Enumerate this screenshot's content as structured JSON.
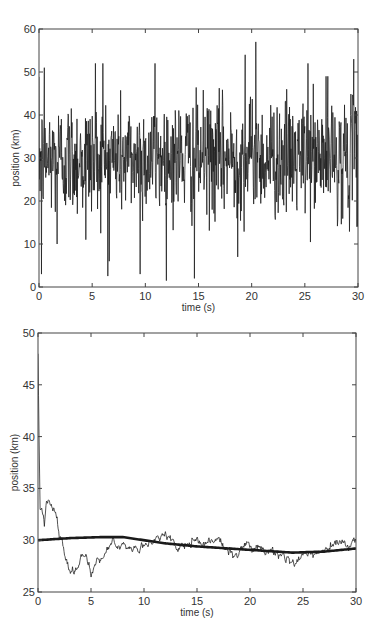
{
  "chart_data": [
    {
      "id": "top",
      "type": "line",
      "title": "",
      "xlabel": "time (s)",
      "ylabel": "position (km)",
      "xlim": [
        0,
        30
      ],
      "ylim": [
        0,
        60
      ],
      "xticks": [
        0,
        5,
        10,
        15,
        20,
        25,
        30
      ],
      "yticks": [
        0,
        10,
        20,
        30,
        40,
        50,
        60
      ],
      "grid": false,
      "legend": null,
      "series": [
        {
          "name": "measured position",
          "style": "thin",
          "color": "#1a1a1a",
          "description": "Noisy measurements around mean ~30 km, std ~8 km, sampled densely over 0-30 s",
          "mean": 30,
          "std": 8,
          "n_points": 900,
          "notable_points": [
            {
              "x": 0.25,
              "y": 3
            },
            {
              "x": 0.5,
              "y": 51
            },
            {
              "x": 1.7,
              "y": 10
            },
            {
              "x": 4.4,
              "y": 11
            },
            {
              "x": 5.3,
              "y": 52
            },
            {
              "x": 6.0,
              "y": 52
            },
            {
              "x": 6.6,
              "y": 6
            },
            {
              "x": 9.5,
              "y": 3
            },
            {
              "x": 10.9,
              "y": 52
            },
            {
              "x": 14.6,
              "y": 2
            },
            {
              "x": 18.7,
              "y": 7
            },
            {
              "x": 19.4,
              "y": 54
            },
            {
              "x": 20.4,
              "y": 57
            },
            {
              "x": 25.3,
              "y": 52
            },
            {
              "x": 27.0,
              "y": 49
            },
            {
              "x": 29.6,
              "y": 53
            },
            {
              "x": 29.9,
              "y": 14
            }
          ]
        }
      ]
    },
    {
      "id": "bottom",
      "type": "line",
      "title": "",
      "xlabel": "time (s)",
      "ylabel": "position (km)",
      "xlim": [
        0,
        30
      ],
      "ylim": [
        25,
        50
      ],
      "xticks": [
        0,
        5,
        10,
        15,
        20,
        25,
        30
      ],
      "yticks": [
        25,
        30,
        35,
        40,
        45,
        50
      ],
      "grid": false,
      "legend": null,
      "series": [
        {
          "name": "running estimate",
          "style": "thin",
          "color": "#1a1a1a",
          "anchor_points": [
            {
              "x": 0,
              "y": 48
            },
            {
              "x": 0.1,
              "y": 40
            },
            {
              "x": 0.2,
              "y": 33
            },
            {
              "x": 0.5,
              "y": 32.5
            },
            {
              "x": 0.6,
              "y": 31.5
            },
            {
              "x": 0.8,
              "y": 33.5
            },
            {
              "x": 1.0,
              "y": 33.8
            },
            {
              "x": 1.5,
              "y": 32.8
            },
            {
              "x": 1.8,
              "y": 32
            },
            {
              "x": 2.0,
              "y": 30.5
            },
            {
              "x": 2.3,
              "y": 29.8
            },
            {
              "x": 2.6,
              "y": 28.2
            },
            {
              "x": 3.0,
              "y": 27
            },
            {
              "x": 3.5,
              "y": 27
            },
            {
              "x": 4.0,
              "y": 28.3
            },
            {
              "x": 4.3,
              "y": 28.8
            },
            {
              "x": 4.8,
              "y": 27.8
            },
            {
              "x": 5.0,
              "y": 26.5
            },
            {
              "x": 5.3,
              "y": 27.5
            },
            {
              "x": 5.6,
              "y": 28.4
            },
            {
              "x": 6.0,
              "y": 28
            },
            {
              "x": 6.5,
              "y": 29.2
            },
            {
              "x": 7.0,
              "y": 29.9
            },
            {
              "x": 7.5,
              "y": 29.0
            },
            {
              "x": 8.0,
              "y": 29.5
            },
            {
              "x": 9.0,
              "y": 29.2
            },
            {
              "x": 10.0,
              "y": 29.4
            },
            {
              "x": 10.5,
              "y": 29.8
            },
            {
              "x": 11.5,
              "y": 30.3
            },
            {
              "x": 12.0,
              "y": 30.8
            },
            {
              "x": 12.6,
              "y": 30.0
            },
            {
              "x": 13.2,
              "y": 29.0
            },
            {
              "x": 13.8,
              "y": 29.6
            },
            {
              "x": 14.5,
              "y": 29.8
            },
            {
              "x": 15.5,
              "y": 29.7
            },
            {
              "x": 16.5,
              "y": 30.0
            },
            {
              "x": 17.5,
              "y": 29.7
            },
            {
              "x": 18.0,
              "y": 29.0
            },
            {
              "x": 18.5,
              "y": 28.6
            },
            {
              "x": 19.0,
              "y": 28.8
            },
            {
              "x": 19.5,
              "y": 29.4
            },
            {
              "x": 20.5,
              "y": 29.3
            },
            {
              "x": 21.5,
              "y": 29.0
            },
            {
              "x": 22.5,
              "y": 28.8
            },
            {
              "x": 23.5,
              "y": 28.4
            },
            {
              "x": 24.4,
              "y": 27.9
            },
            {
              "x": 25.0,
              "y": 28.4
            },
            {
              "x": 25.5,
              "y": 28.8
            },
            {
              "x": 26.5,
              "y": 28.8
            },
            {
              "x": 27.5,
              "y": 29.2
            },
            {
              "x": 28.2,
              "y": 29.8
            },
            {
              "x": 28.8,
              "y": 29.6
            },
            {
              "x": 29.3,
              "y": 29.4
            },
            {
              "x": 29.7,
              "y": 29.8
            },
            {
              "x": 30.0,
              "y": 30.0
            }
          ]
        },
        {
          "name": "smoothed estimate",
          "style": "thick",
          "color": "#1a1a1a",
          "anchor_points": [
            {
              "x": 0,
              "y": 30.0
            },
            {
              "x": 3,
              "y": 30.2
            },
            {
              "x": 6,
              "y": 30.3
            },
            {
              "x": 8,
              "y": 30.3
            },
            {
              "x": 10,
              "y": 30.0
            },
            {
              "x": 12,
              "y": 29.7
            },
            {
              "x": 15,
              "y": 29.4
            },
            {
              "x": 18,
              "y": 29.2
            },
            {
              "x": 21,
              "y": 29.0
            },
            {
              "x": 24,
              "y": 28.8
            },
            {
              "x": 27,
              "y": 28.9
            },
            {
              "x": 30,
              "y": 29.2
            }
          ]
        }
      ]
    }
  ],
  "layout": {
    "top": {
      "left": 39,
      "right": 358,
      "top": 29,
      "bottom": 287
    },
    "bottom": {
      "left": 38,
      "right": 356,
      "top": 333,
      "bottom": 592
    }
  }
}
